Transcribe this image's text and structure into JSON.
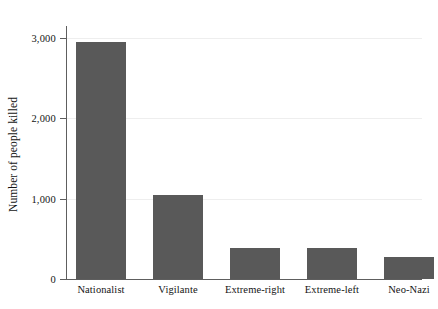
{
  "chart_data": {
    "type": "bar",
    "title": "",
    "subtitle": "",
    "xlabel": "",
    "ylabel": "Number of people killed",
    "categories": [
      "Nationalist",
      "Vigilante",
      "Extreme-right",
      "Extreme-left",
      "Neo-Nazi"
    ],
    "values": [
      2950,
      1040,
      380,
      385,
      275
    ],
    "series": [
      {
        "name": "Number of people killed",
        "values": [
          2950,
          1040,
          380,
          385,
          275
        ]
      }
    ],
    "ylim": [
      0,
      3150
    ],
    "ytick_values": [
      0,
      1000,
      2000,
      3000
    ],
    "ytick_labels": [
      "0",
      "1,000",
      "2,000",
      "3,000"
    ],
    "grid": true,
    "grid_axis": "y",
    "legend": false,
    "legend_position": "none",
    "bar_color": "#595959",
    "background_color": "#ffffff",
    "gridline_color": "#eeeeee",
    "axis_color": "#5e5e5e",
    "text_color": "#141414",
    "annotations": []
  }
}
